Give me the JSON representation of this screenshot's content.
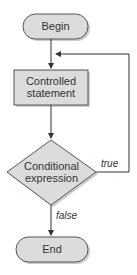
{
  "diagram": {
    "type": "flowchart",
    "colors": {
      "fill": "#dcdcdc",
      "stroke": "#444444",
      "line": "#333333"
    },
    "nodes": {
      "begin": {
        "label": "Begin",
        "shape": "terminal"
      },
      "statement": {
        "label_line1": "Controlled",
        "label_line2": "statement",
        "shape": "process"
      },
      "condition": {
        "label_line1": "Conditional",
        "label_line2": "expression",
        "shape": "decision"
      },
      "end": {
        "label": "End",
        "shape": "terminal"
      }
    },
    "edges": {
      "true_label": "true",
      "false_label": "false"
    }
  }
}
